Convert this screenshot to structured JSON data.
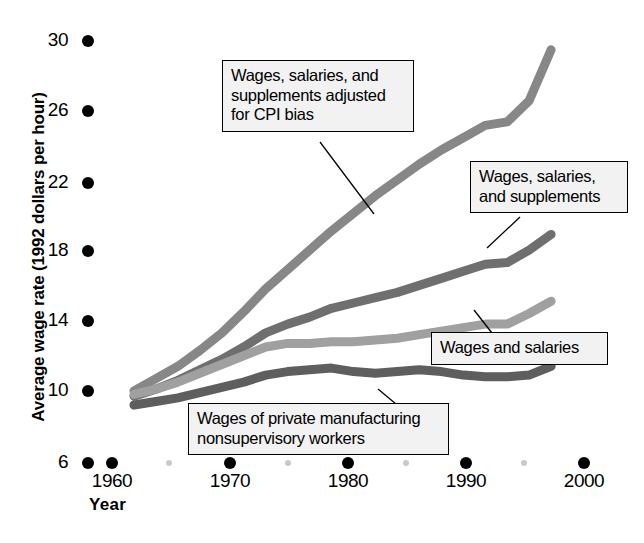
{
  "chart_data": {
    "type": "line",
    "title": "",
    "xlabel": "Year",
    "ylabel": "Average wage rate (1992 dollars per hour)",
    "xlim": [
      1958,
      2001
    ],
    "ylim": [
      6,
      30
    ],
    "x_ticks": [
      "1960",
      "1970",
      "1980",
      "1990",
      "2000"
    ],
    "x_minor_ticks": [
      "1965",
      "1975",
      "1985",
      "1995"
    ],
    "y_ticks": [
      "6",
      "10",
      "14",
      "18",
      "22",
      "26",
      "30"
    ],
    "grid": false,
    "legend_position": "inline-callouts",
    "x": [
      1960,
      1962,
      1964,
      1966,
      1968,
      1970,
      1972,
      1974,
      1976,
      1978,
      1980,
      1982,
      1984,
      1986,
      1988,
      1990,
      1992,
      1994,
      1996,
      1998
    ],
    "series": [
      {
        "name": "Wages, salaries, and supplements adjusted for CPI bias",
        "color": "#878787",
        "values": [
          10.1,
          10.8,
          11.5,
          12.4,
          13.4,
          14.6,
          15.9,
          17.0,
          18.1,
          19.2,
          20.2,
          21.2,
          22.1,
          23.0,
          23.8,
          24.5,
          25.2,
          25.4,
          26.6,
          29.5
        ]
      },
      {
        "name": "Wages, salaries, and supplements",
        "color": "#6f6f6f",
        "values": [
          9.8,
          10.2,
          10.7,
          11.3,
          11.9,
          12.6,
          13.4,
          13.9,
          14.3,
          14.8,
          15.1,
          15.4,
          15.7,
          16.1,
          16.5,
          16.9,
          17.3,
          17.4,
          18.1,
          19.0
        ]
      },
      {
        "name": "Wages and salaries",
        "color": "#a0a0a0",
        "values": [
          9.9,
          10.2,
          10.6,
          11.1,
          11.6,
          12.1,
          12.6,
          12.8,
          12.8,
          12.9,
          12.9,
          13.0,
          13.1,
          13.3,
          13.5,
          13.7,
          13.9,
          13.9,
          14.5,
          15.2
        ]
      },
      {
        "name": "Wages of private manufacturing nonsupervisory workers",
        "color": "#5e5e5e",
        "values": [
          9.3,
          9.5,
          9.7,
          10.0,
          10.3,
          10.6,
          11.0,
          11.2,
          11.3,
          11.4,
          11.2,
          11.1,
          11.2,
          11.3,
          11.2,
          11.0,
          10.9,
          10.9,
          11.0,
          11.5
        ]
      }
    ],
    "annotations": [
      {
        "id": "callout-cpi-adjusted",
        "lines": [
          "Wages, salaries, and",
          "supplements adjusted",
          "for CPI bias"
        ]
      },
      {
        "id": "callout-wages-supplements",
        "lines": [
          "Wages, salaries,",
          "and supplements"
        ]
      },
      {
        "id": "callout-wages-salaries",
        "lines": [
          "Wages and salaries"
        ]
      },
      {
        "id": "callout-manufacturing",
        "lines": [
          "Wages of private manufacturing",
          "nonsupervisory workers"
        ]
      }
    ]
  },
  "colors": {
    "background": "#ffffff",
    "axis_dot_major": "#000000",
    "axis_dot_minor": "#c9c9c9",
    "callout_fill": "#f2f2f2",
    "callout_border": "#000000"
  }
}
